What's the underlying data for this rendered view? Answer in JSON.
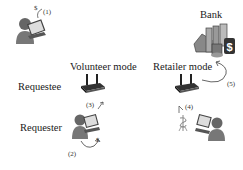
{
  "labels": {
    "bank": "Bank",
    "volunteer_mode": "Volunteer mode",
    "retailer_mode": "Retailer mode",
    "requestee": "Requestee",
    "requester": "Requester"
  },
  "steps": {
    "s1": "(1)",
    "s2": "(2)",
    "s3": "(3)",
    "s4": "(4)",
    "s5": "(5)"
  },
  "symbols": {
    "dollar": "$"
  },
  "icons": [
    "user-laptop-icon",
    "router-icon",
    "bank-buildings-icon",
    "money-icon"
  ]
}
